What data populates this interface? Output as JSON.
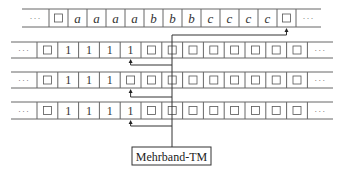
{
  "diagram": {
    "title": "Mehrband-TM",
    "machine_label": "Mehrband-TM",
    "ellipsis": "···",
    "tapes": [
      {
        "name": "tape-1",
        "cells": [
          "□",
          "a",
          "a",
          "a",
          "a",
          "b",
          "b",
          "b",
          "c",
          "c",
          "c",
          "c",
          "□"
        ],
        "head_index": 12
      },
      {
        "name": "tape-2",
        "cells": [
          "□",
          "1",
          "1",
          "1",
          "1",
          "□",
          "□",
          "□",
          "□",
          "□",
          "□",
          "□",
          "□"
        ],
        "head_index": 4
      },
      {
        "name": "tape-3",
        "cells": [
          "□",
          "1",
          "1",
          "1",
          "□",
          "□",
          "□",
          "□",
          "□",
          "□",
          "□",
          "□",
          "□"
        ],
        "head_index": 4
      },
      {
        "name": "tape-4",
        "cells": [
          "□",
          "1",
          "1",
          "1",
          "1",
          "□",
          "□",
          "□",
          "□",
          "□",
          "□",
          "□",
          "□"
        ],
        "head_index": 4
      }
    ]
  }
}
